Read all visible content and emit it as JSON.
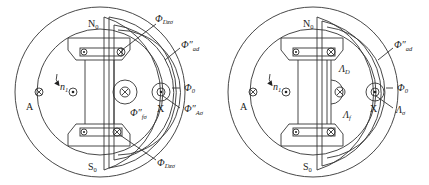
{
  "figures": [
    {
      "id": "left",
      "labels": {
        "north_pole": "N",
        "north_sub": "0",
        "south_pole": "S",
        "south_sub": "0",
        "phase_a": "A",
        "phase_x": "X",
        "speed": "n",
        "speed_sub": "1",
        "phi_dz_sigma_top": "Φ",
        "phi_dz_sigma_top_sub": "Dzσ",
        "phi_ad": "Φ″",
        "phi_ad_sub": "ad",
        "phi_0": "Φ",
        "phi_0_sub": "0",
        "phi_a_sigma": "Φ″",
        "phi_a_sigma_sub": "Aσ",
        "phi_f_sigma": "Φ″",
        "phi_f_sigma_sub": "fσ",
        "phi_dz_sigma_bottom": "Φ",
        "phi_dz_sigma_bottom_sub": "Dzσ"
      }
    },
    {
      "id": "right",
      "labels": {
        "north_pole": "N",
        "north_sub": "0",
        "south_pole": "S",
        "south_sub": "0",
        "phase_a": "A",
        "phase_x": "X",
        "speed": "n",
        "speed_sub": "1",
        "phi_ad": "Φ″",
        "phi_ad_sub": "ad",
        "phi_0": "Φ",
        "phi_0_sub": "0",
        "lambda_d": "Λ",
        "lambda_d_sub": "D",
        "lambda_f": "Λ",
        "lambda_f_sub": "f",
        "lambda_sigma": "Λ",
        "lambda_sigma_sub": "σ"
      }
    }
  ]
}
